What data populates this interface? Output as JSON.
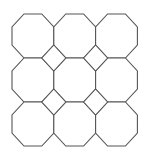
{
  "diagram": {
    "type": "truncated-square-tiling",
    "rows": 3,
    "cols": 3,
    "origin": [
      12,
      14
    ],
    "cell_width": 41.8,
    "cell_height": 44,
    "corner_cut_x": 12,
    "corner_cut_y": 13,
    "octagon_count": 9,
    "square_count": 4,
    "stroke_color": "#555555",
    "fill_color": "#ffffff",
    "background": "#ffffff"
  }
}
